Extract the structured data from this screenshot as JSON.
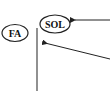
{
  "diagram": {
    "nodes": [
      {
        "id": "fa",
        "label": "FA",
        "cx": 15,
        "cy": 33,
        "rx": 13,
        "ry": 8.5
      },
      {
        "id": "sol",
        "label": "SOL",
        "cx": 55,
        "cy": 24,
        "rx": 15,
        "ry": 9
      }
    ],
    "vertical_line": {
      "x": 37,
      "y1": 28,
      "y2": 91
    },
    "arrows": [
      {
        "id": "arrow-to-sol",
        "x1": 110,
        "y1": 20,
        "x2": 73,
        "y2": 20
      },
      {
        "id": "arrow-to-line",
        "x1": 110,
        "y1": 59,
        "x2": 45,
        "y2": 43
      }
    ],
    "colors": {
      "stroke": "#222222",
      "line": "#555555",
      "background": "#ffffff"
    }
  }
}
